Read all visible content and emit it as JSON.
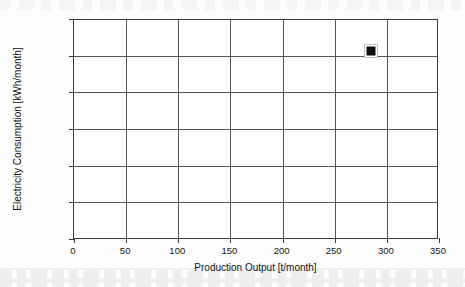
{
  "chart_data": {
    "type": "scatter",
    "title": "",
    "xlabel": "Production Output [t/month]",
    "ylabel": "Electricity Consumption [kWh/month]",
    "xlim": [
      0,
      350
    ],
    "ylim": [
      0,
      30000
    ],
    "grid": true,
    "legend": "none",
    "x_tick_labels": [
      "0",
      "50",
      "100",
      "150",
      "200",
      "250",
      "300",
      "350"
    ],
    "x_tick_values": [
      0,
      50,
      100,
      150,
      200,
      250,
      300,
      350
    ],
    "y_tick_labels": [
      "0",
      "5000",
      "10 000",
      "15 000",
      "20 000",
      "25 000",
      "30 000"
    ],
    "y_tick_values": [
      0,
      5000,
      10000,
      15000,
      20000,
      25000,
      30000
    ],
    "series": [
      {
        "name": "Plant data point",
        "marker": "filled-square",
        "color": "#0d0d0d",
        "points": [
          {
            "x": 285,
            "y": 25700
          }
        ]
      }
    ]
  },
  "axes": {
    "x_title": "Production Output [t/month]",
    "y_title": "Electricity Consumption [kWh/month]"
  }
}
